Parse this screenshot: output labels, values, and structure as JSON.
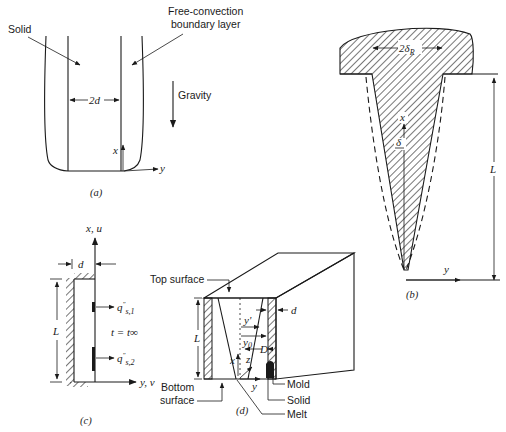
{
  "figure": {
    "panels": [
      {
        "id": "a",
        "caption": "(a)",
        "labels": {
          "solid": "Solid",
          "boundary_layer_line1": "Free-convection",
          "boundary_layer_line2": "boundary layer",
          "gravity": "Gravity",
          "width": "2d",
          "x_axis": "x",
          "y_axis": "y"
        }
      },
      {
        "id": "b",
        "caption": "(b)",
        "labels": {
          "top_width": "2δ",
          "top_width_sub": "R",
          "x_axis": "x",
          "delta": "δ",
          "length": "L",
          "y_axis": "y"
        }
      },
      {
        "id": "c",
        "caption": "(c)",
        "labels": {
          "axis_vertical": "x, u",
          "axis_horizontal": "y, v",
          "thickness": "d",
          "length": "L",
          "flux1": "q\"s,1",
          "flux2": "q\"s,2",
          "ambient": "t = t∞"
        }
      },
      {
        "id": "d",
        "caption": "(d)",
        "labels": {
          "top_surface": "Top surface",
          "bottom_surface_line1": "Bottom",
          "bottom_surface_line2": "surface",
          "length": "L",
          "thickness": "d",
          "y_prime": "y'",
          "y0": "y",
          "y0_sub": "0",
          "D": "D",
          "x": "x",
          "z": "z",
          "y": "y",
          "mold": "Mold",
          "solid": "Solid",
          "melt": "Melt"
        }
      }
    ]
  }
}
